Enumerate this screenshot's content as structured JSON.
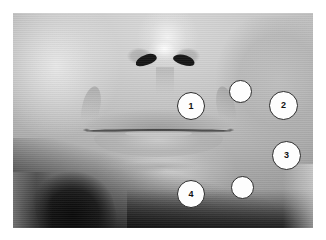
{
  "figure": {
    "type": "annotated-photograph",
    "photo": {
      "colorspace": "grayscale",
      "border_color": "#ffffff",
      "background_color": "#ffffff"
    },
    "markers": [
      {
        "id": "marker-1",
        "label": "1",
        "labeled": true,
        "x": 178,
        "y": 93,
        "diameter": 28,
        "region": "right-upper-lip-perioral"
      },
      {
        "id": "marker-2",
        "label": "2",
        "labeled": true,
        "x": 270,
        "y": 92,
        "diameter": 29,
        "region": "right-cheek-upper"
      },
      {
        "id": "marker-3",
        "label": "3",
        "labeled": true,
        "x": 274,
        "y": 142,
        "diameter": 29,
        "region": "right-cheek-lower"
      },
      {
        "id": "marker-4",
        "label": "4",
        "labeled": true,
        "x": 178,
        "y": 181,
        "diameter": 28,
        "region": "right-chin-perioral"
      },
      {
        "id": "marker-a",
        "label": "",
        "labeled": false,
        "x": 228,
        "y": 79,
        "diameter": 23,
        "region": "right-mid-cheek-upper"
      },
      {
        "id": "marker-b",
        "label": "",
        "labeled": false,
        "x": 230,
        "y": 175,
        "diameter": 23,
        "region": "right-mid-jaw-lower"
      }
    ],
    "marker_style": {
      "fill": "#fdfdfd",
      "outline": "#2b2b2b",
      "text_color": "#111111"
    },
    "features": [
      {
        "name": "nose",
        "visible": true
      },
      {
        "name": "nostrils",
        "visible": true
      },
      {
        "name": "lips",
        "visible": true
      },
      {
        "name": "teeth",
        "visible": true
      },
      {
        "name": "chin",
        "visible": true
      },
      {
        "name": "neck-shadow",
        "visible": true
      }
    ]
  }
}
